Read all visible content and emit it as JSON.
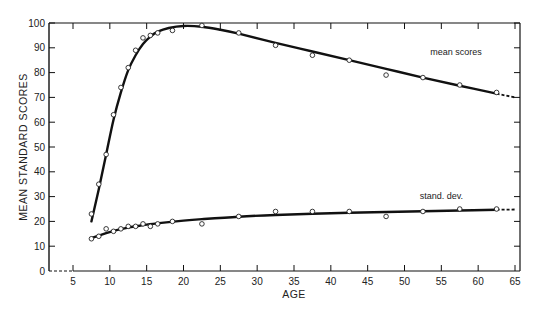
{
  "chart_data": {
    "type": "scatter",
    "title": "",
    "xlabel": "AGE",
    "ylabel": "MEAN STANDARD SCORES",
    "xlim": [
      0,
      66
    ],
    "ylim": [
      0,
      100
    ],
    "x_ticks": [
      5,
      10,
      15,
      20,
      25,
      30,
      35,
      40,
      45,
      50,
      55,
      60,
      65
    ],
    "y_ticks": [
      0,
      10,
      20,
      30,
      40,
      50,
      60,
      70,
      80,
      90,
      100
    ],
    "grid": false,
    "legend": "inline labels",
    "series": [
      {
        "name": "mean scores",
        "label_anchor": [
          57,
          87
        ],
        "points": {
          "x": [
            7.5,
            8.5,
            9.5,
            10.5,
            11.5,
            12.5,
            13.5,
            14.5,
            15.5,
            16.5,
            18.5,
            22.5,
            27.5,
            32.5,
            37.5,
            42.5,
            47.5,
            52.5,
            57.5,
            62.5
          ],
          "y": [
            23,
            35,
            47,
            63,
            74,
            82,
            89,
            94,
            95,
            96,
            97,
            99,
            96,
            91,
            87,
            85,
            79,
            78,
            75,
            72
          ]
        },
        "fit_curve": {
          "x": [
            7.5,
            8.5,
            9.5,
            10.5,
            11.5,
            12.5,
            13.5,
            14.5,
            15.5,
            16.5,
            18,
            20,
            22.5,
            25,
            27.5,
            32.5,
            37.5,
            42.5,
            47.5,
            52.5,
            57.5,
            62.5
          ],
          "y": [
            20,
            33,
            47,
            61,
            72,
            81,
            87,
            91.5,
            94.5,
            96.5,
            98,
            98.8,
            98.5,
            97.3,
            95.7,
            92,
            88.5,
            85,
            81.5,
            78,
            74.7,
            71.5
          ]
        },
        "extrapolated": {
          "x": [
            62.5,
            65
          ],
          "y": [
            71.5,
            70
          ]
        }
      },
      {
        "name": "stand. dev.",
        "label_anchor": [
          55,
          29
        ],
        "points": {
          "x": [
            7.5,
            8.5,
            9.5,
            10.5,
            11.5,
            12.5,
            13.5,
            14.5,
            15.5,
            16.5,
            18.5,
            22.5,
            27.5,
            32.5,
            37.5,
            42.5,
            47.5,
            52.5,
            57.5,
            62.5
          ],
          "y": [
            13,
            14,
            17,
            16,
            17,
            18,
            18,
            19,
            18,
            19,
            20,
            19,
            22,
            24,
            24,
            24,
            22,
            24,
            25,
            25
          ]
        },
        "fit_curve": {
          "x": [
            7.5,
            8.5,
            9.5,
            10.5,
            11.5,
            12.5,
            13.5,
            15,
            17,
            20,
            22.5,
            27.5,
            32.5,
            37.5,
            42.5,
            47.5,
            52.5,
            57.5,
            62.5
          ],
          "y": [
            13.2,
            14.3,
            15.3,
            16.2,
            16.9,
            17.5,
            18,
            18.7,
            19.4,
            20.3,
            20.9,
            21.9,
            22.6,
            23.1,
            23.5,
            23.8,
            24.1,
            24.4,
            24.7
          ]
        },
        "extrapolated": {
          "x": [
            62.5,
            65
          ],
          "y": [
            24.7,
            24.8
          ]
        }
      }
    ],
    "y_axis_extension": {
      "x": [
        0,
        5
      ],
      "y": [
        0,
        0
      ],
      "style": "dashed"
    }
  }
}
